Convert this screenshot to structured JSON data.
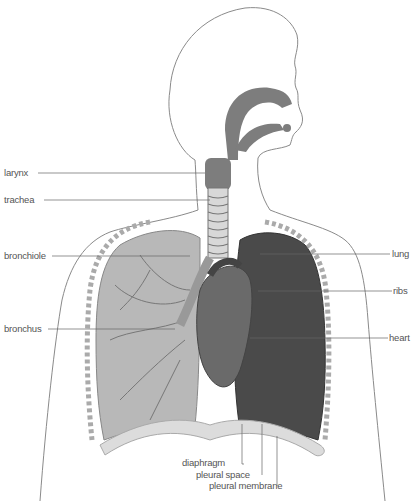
{
  "figure": {
    "labels_left": {
      "larynx": "larynx",
      "trachea": "trachea",
      "bronchiole": "bronchiole",
      "bronchus": "bronchus"
    },
    "labels_right": {
      "lung": "lung",
      "ribs": "ribs",
      "heart": "heart"
    },
    "labels_bottom": {
      "diaphragm": "diaphragm",
      "pleural_space": "pleural space",
      "pleural_membrane": "pleural membrane"
    },
    "colors": {
      "outline": "#8a8a8a",
      "airway": "#7d7d7d",
      "lung_left": "#b8b8b8",
      "lung_right": "#4a4a4a",
      "heart": "#6a6a6a",
      "leader_line": "#666666"
    }
  }
}
